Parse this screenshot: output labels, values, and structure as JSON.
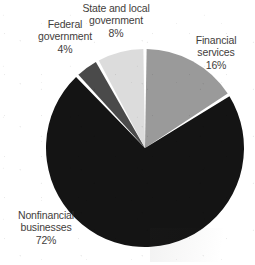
{
  "chart_data": {
    "type": "pie",
    "title": "",
    "subtitle": "",
    "xlabel": "",
    "ylabel": "",
    "legend_position": "none",
    "grid": false,
    "start_angle_deg": 0,
    "direction": "clockwise",
    "units": "percent",
    "categories": [
      "Financial services",
      "Nonfinancial businesses",
      "Federal government",
      "State and local government"
    ],
    "values": [
      16,
      72,
      4,
      8
    ],
    "value_labels": [
      "16%",
      "72%",
      "4%",
      "8%"
    ],
    "colors": [
      "#9a9a9a",
      "#141414",
      "#4a4a4a",
      "#dcdcdc"
    ],
    "slices": [
      {
        "label": "Financial services",
        "value": 16,
        "value_label": "16%",
        "color": "#9a9a9a",
        "start_deg": 0,
        "end_deg": 57.6
      },
      {
        "label": "Nonfinancial businesses",
        "value": 72,
        "value_label": "72%",
        "color": "#141414",
        "start_deg": 57.6,
        "end_deg": 316.8
      },
      {
        "label": "Federal government",
        "value": 4,
        "value_label": "4%",
        "color": "#4a4a4a",
        "start_deg": 316.8,
        "end_deg": 331.2
      },
      {
        "label": "State and local government",
        "value": 8,
        "value_label": "8%",
        "color": "#dcdcdc",
        "start_deg": 331.2,
        "end_deg": 360
      }
    ]
  },
  "labels": {
    "financial_services": "Financial\nservices\n16%",
    "nonfinancial_businesses": "Nonfinancial\nbusinesses\n72%",
    "federal_government": "Federal\ngovernment\n4%",
    "state_and_local_government": "State and local\ngovernment\n8%"
  },
  "style": {
    "background": "#ffffff",
    "label_text_color": "#33302e",
    "separator_color": "#ffffff"
  }
}
